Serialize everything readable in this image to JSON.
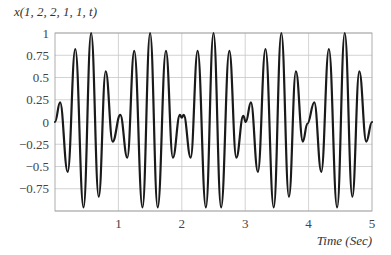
{
  "chart_data": {
    "type": "line",
    "title": "x(1, 2, 2, 1, 1, t)",
    "xlabel": "Time (Sec)",
    "ylabel": "x(1, 2, 2, 1, 1, t)",
    "xlim": [
      0,
      5
    ],
    "ylim": [
      -1,
      1
    ],
    "x_ticks": [
      1,
      2,
      3,
      4,
      5
    ],
    "x_tick_labels": [
      "1",
      "2",
      "3",
      "4",
      "5"
    ],
    "y_ticks": [
      1,
      0.75,
      0.5,
      0.25,
      0,
      -0.25,
      -0.5,
      -0.75
    ],
    "y_tick_labels": [
      "1",
      "0.75",
      "0.5",
      "0.25",
      "0",
      "−0.25",
      "−0.5",
      "−0.75"
    ],
    "grid": true,
    "legend": null,
    "series": [
      {
        "name": "x(1, 2, 2, 1, 1, t)",
        "color": "#1a1a1a",
        "points": [
          [
            0.0,
            0.0
          ],
          [
            0.08,
            0.22
          ],
          [
            0.2,
            -0.56
          ],
          [
            0.32,
            0.82
          ],
          [
            0.45,
            -0.96
          ],
          [
            0.57,
            1.0
          ],
          [
            0.69,
            -0.84
          ],
          [
            0.8,
            0.57
          ],
          [
            0.91,
            -0.22
          ],
          [
            1.03,
            0.08
          ],
          [
            1.14,
            -0.4
          ],
          [
            1.25,
            0.8
          ],
          [
            1.38,
            -0.96
          ],
          [
            1.5,
            1.0
          ],
          [
            1.62,
            -0.96
          ],
          [
            1.75,
            0.8
          ],
          [
            1.86,
            -0.4
          ],
          [
            1.97,
            0.08
          ],
          [
            2.0,
            0.05
          ],
          [
            2.03,
            0.08
          ],
          [
            2.14,
            -0.4
          ],
          [
            2.25,
            0.8
          ],
          [
            2.38,
            -0.96
          ],
          [
            2.5,
            1.0
          ],
          [
            2.62,
            -0.96
          ],
          [
            2.75,
            0.8
          ],
          [
            2.86,
            -0.4
          ],
          [
            2.97,
            0.07
          ],
          [
            3.01,
            0.0
          ],
          [
            3.09,
            0.22
          ],
          [
            3.2,
            -0.56
          ],
          [
            3.32,
            0.82
          ],
          [
            3.45,
            -0.96
          ],
          [
            3.57,
            1.0
          ],
          [
            3.69,
            -0.84
          ],
          [
            3.8,
            0.57
          ],
          [
            3.91,
            -0.22
          ],
          [
            3.98,
            -0.02
          ],
          [
            4.09,
            0.22
          ],
          [
            4.2,
            -0.56
          ],
          [
            4.32,
            0.82
          ],
          [
            4.45,
            -0.96
          ],
          [
            4.57,
            1.0
          ],
          [
            4.69,
            -0.84
          ],
          [
            4.8,
            0.57
          ],
          [
            4.91,
            -0.22
          ],
          [
            5.0,
            0.0
          ]
        ]
      }
    ]
  },
  "layout": {
    "plot_left": 55,
    "plot_top": 33,
    "plot_right": 372,
    "plot_bottom": 211
  }
}
